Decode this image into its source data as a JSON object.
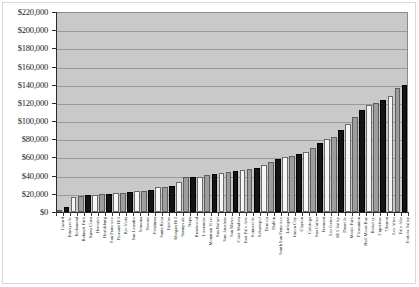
{
  "chart_data": {
    "type": "bar",
    "title": "",
    "subtitle": "",
    "xlabel": "",
    "ylabel": "",
    "ylim": [
      0,
      220000
    ],
    "ytick_step": 20000,
    "grid": true,
    "legend": "none",
    "y_ticks": [
      "$220,000",
      "$200,000",
      "$180,000",
      "$160,000",
      "$140,000",
      "$120,000",
      "$100,000",
      "$80,000",
      "$60,000",
      "$40,000",
      "$20,000",
      "$0"
    ],
    "y_tick_values": [
      220000,
      200000,
      180000,
      160000,
      140000,
      120000,
      100000,
      80000,
      60000,
      40000,
      20000,
      0
    ],
    "bar_palette": [
      "#9d9d9d",
      "#141414",
      "#f6f6f6"
    ],
    "plot_background": "#c9c9c9",
    "categories": [
      "Cazard",
      "Emeryville",
      "Richmond",
      "Rohnert Park",
      "Santa Clara",
      "Hercules",
      "Healdsburg",
      "San Francisco",
      "Pleasant Hill",
      "Rio Vista",
      "San Leandro",
      "Sonoma",
      "Novato",
      "Petaluma",
      "Santa Rosa",
      "Fairfax",
      "Morgan Hill",
      "Sunnyvale",
      "Napa",
      "Brentwood",
      "Livermore",
      "Mountain View",
      "San Rafael",
      "San Anselmo",
      "San Mateo",
      "Corte Madera",
      "East Palo Alto",
      "Somerville",
      "Sebastopol",
      "Benicia",
      "Dublin",
      "South San Francisco",
      "Larkspur",
      "Union City",
      "Clayton",
      "Calistoga",
      "San Carlos",
      "Fremont",
      "Los Gatos",
      "Mill Valley",
      "Danville",
      "Menlo Park",
      "Pleasanton",
      "Half Moon Bay",
      "Berkeley",
      "Cupertino",
      "Tiburon",
      "Los Altos",
      "Palo Alto",
      "Portola Valley"
    ],
    "values": [
      2000,
      6000,
      16000,
      18000,
      19000,
      19000,
      19500,
      20000,
      20500,
      21000,
      22000,
      23000,
      23500,
      24000,
      27000,
      28000,
      28500,
      33000,
      38000,
      38500,
      39000,
      41000,
      42000,
      43000,
      44000,
      45000,
      46000,
      47000,
      48000,
      52000,
      55000,
      58000,
      60000,
      62000,
      64000,
      66000,
      70000,
      76000,
      80000,
      82000,
      90000,
      97000,
      104000,
      112000,
      118000,
      120000,
      123000,
      128000,
      136000,
      140000
    ]
  }
}
